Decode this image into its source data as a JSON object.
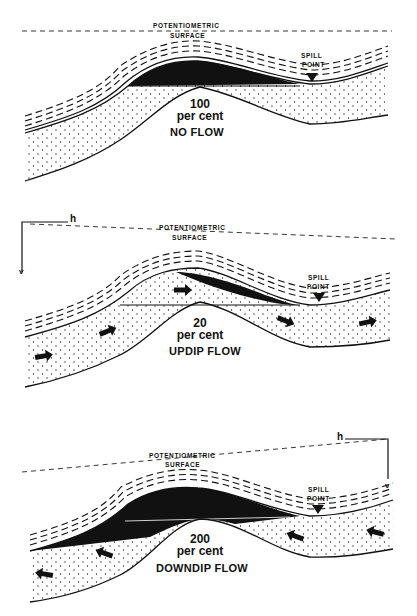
{
  "panels": [
    {
      "id": "no-flow",
      "potentiometric_label_1": "POTENTIOMETRIC",
      "potentiometric_label_2": "SURFACE",
      "spill_label_1": "SPILL",
      "spill_label_2": "POINT",
      "percent": "100",
      "percent_unit": "per cent",
      "flow_label": "NO FLOW"
    },
    {
      "id": "updip-flow",
      "potentiometric_label_1": "POTENTIOMETRIC",
      "potentiometric_label_2": "SURFACE",
      "spill_label_1": "SPILL",
      "spill_label_2": "POINT",
      "percent": "20",
      "percent_unit": "per cent",
      "flow_label": "UPDIP FLOW",
      "axis_h": "h",
      "axis_v": "v"
    },
    {
      "id": "downdip-flow",
      "potentiometric_label_1": "POTENTIOMETRIC",
      "potentiometric_label_2": "SURFACE",
      "spill_label_1": "SPILL",
      "spill_label_2": "POINT",
      "percent": "200",
      "percent_unit": "per cent",
      "flow_label": "DOWNDIP FLOW",
      "axis_h": "h",
      "axis_v": "v"
    }
  ]
}
